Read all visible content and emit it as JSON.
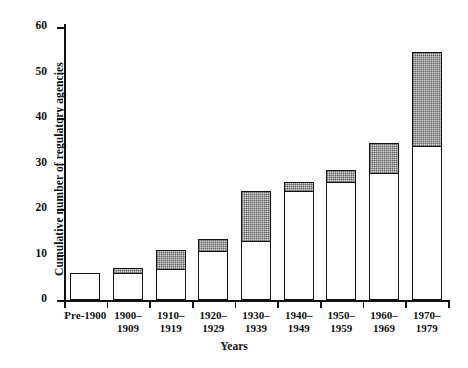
{
  "chart_data": {
    "type": "bar",
    "title": "",
    "xlabel": "Years",
    "ylabel": "Cumulative number of regulatory agencies",
    "ylim": [
      0,
      60
    ],
    "yticks": [
      0,
      10,
      20,
      30,
      40,
      50,
      60
    ],
    "grid": false,
    "legend": false,
    "stacked": true,
    "categories": [
      "Pre-1900",
      "1900–\n1909",
      "1910–\n1919",
      "1920–\n1929",
      "1930–\n1939",
      "1940–\n1949",
      "1950–\n1959",
      "1960–\n1969",
      "1970–\n1979"
    ],
    "series": [
      {
        "name": "carried-forward (white)",
        "values": [
          6,
          6,
          7,
          11,
          13,
          24,
          26,
          28,
          34
        ]
      },
      {
        "name": "added in decade (shaded)",
        "values": [
          0,
          1,
          4,
          2.5,
          11,
          2,
          2.5,
          6.5,
          20.5
        ]
      }
    ],
    "totals": [
      6,
      7,
      11,
      13.5,
      24,
      26,
      28.5,
      34.5,
      54.5
    ],
    "colors": {
      "axis": "#111111",
      "bar_fill": "#ffffff",
      "bar_shaded_fill": "#d8d8d8",
      "bar_border": "#111111"
    }
  },
  "axes": {
    "y_title": "Cumulative number of regulatory agencies",
    "x_title": "Years",
    "y_tick_labels": [
      "0",
      "10",
      "20",
      "30",
      "40",
      "50",
      "60"
    ],
    "x_tick_labels": [
      "Pre-1900",
      "1900–\n1909",
      "1910–\n1919",
      "1920–\n1929",
      "1930–\n1939",
      "1940–\n1949",
      "1950–\n1959",
      "1960–\n1969",
      "1970–\n1979"
    ]
  }
}
